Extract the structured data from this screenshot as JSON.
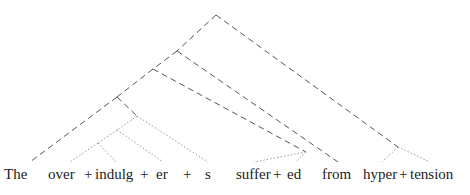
{
  "diagram": {
    "type": "morphological-parse-tree",
    "line_styles": {
      "word_level": "dashed",
      "morpheme_level": "dotted"
    },
    "tokens": [
      {
        "text": "The",
        "x": 4
      },
      {
        "text": "over",
        "x": 48
      },
      {
        "text": "+",
        "x": 84
      },
      {
        "text": "indulg",
        "x": 95
      },
      {
        "text": "+",
        "x": 140
      },
      {
        "text": "er",
        "x": 156
      },
      {
        "text": "+",
        "x": 183
      },
      {
        "text": "s",
        "x": 205
      },
      {
        "text": "suffer",
        "x": 236
      },
      {
        "text": "+",
        "x": 273
      },
      {
        "text": "ed",
        "x": 287
      },
      {
        "text": "from",
        "x": 322
      },
      {
        "text": "hyper",
        "x": 363
      },
      {
        "text": "+",
        "x": 399
      },
      {
        "text": "tension",
        "x": 410
      }
    ],
    "words": [
      "The",
      "over+indulg+er+s",
      "suffer+ed",
      "from",
      "hyper+tension"
    ],
    "colors": {
      "dashed_line": "#555555",
      "dotted_line": "#9a9a9a",
      "text": "#222222"
    }
  }
}
